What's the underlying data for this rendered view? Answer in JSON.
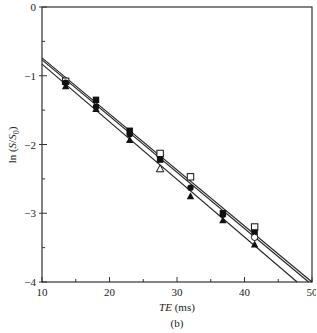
{
  "chart_data": {
    "type": "scatter",
    "title": "",
    "panel_label": "(b)",
    "xlabel": "TE (ms)",
    "xlabel_italic_part": "TE",
    "xlabel_unit": "(ms)",
    "ylabel": "ln (S/S0)",
    "xlim": [
      10,
      50
    ],
    "ylim": [
      -4,
      0
    ],
    "x_ticks": [
      10,
      20,
      30,
      40,
      50
    ],
    "x_minor_ticks": [
      15,
      25,
      35,
      45
    ],
    "y_ticks": [
      0,
      -1,
      -2,
      -3,
      -4
    ],
    "y_minor_ticks": [
      -0.5,
      -1.5,
      -2.5,
      -3.5
    ],
    "grid": false,
    "legend": "none",
    "series": [
      {
        "name": "open-square",
        "marker": "square-open",
        "x": [
          13.5,
          27.5,
          32.0,
          41.5
        ],
        "y": [
          -1.08,
          -2.13,
          -2.47,
          -3.2
        ]
      },
      {
        "name": "filled-square",
        "marker": "square-filled",
        "x": [
          18.0,
          23.0,
          27.5,
          36.8,
          41.5
        ],
        "y": [
          -1.35,
          -1.8,
          -2.22,
          -3.0,
          -3.28
        ]
      },
      {
        "name": "filled-circle",
        "marker": "circle-filled",
        "x": [
          13.5,
          18.0,
          23.0,
          32.0,
          36.8
        ],
        "y": [
          -1.1,
          -1.45,
          -1.85,
          -2.63,
          -3.02
        ]
      },
      {
        "name": "open-circle",
        "marker": "circle-open",
        "x": [
          41.5
        ],
        "y": [
          -3.35
        ]
      },
      {
        "name": "filled-triangle",
        "marker": "triangle-filled",
        "x": [
          13.5,
          18.0,
          23.0,
          32.0,
          36.8,
          41.5
        ],
        "y": [
          -1.15,
          -1.48,
          -1.93,
          -2.75,
          -3.1,
          -3.45
        ]
      },
      {
        "name": "open-triangle",
        "marker": "triangle-open",
        "x": [
          27.5
        ],
        "y": [
          -2.35
        ]
      }
    ],
    "fit_lines": [
      {
        "name": "fit-1",
        "x": [
          10,
          50
        ],
        "y": [
          -0.74,
          -4.0
        ]
      },
      {
        "name": "fit-2",
        "x": [
          10,
          49.5
        ],
        "y": [
          -0.77,
          -4.0
        ]
      },
      {
        "name": "fit-3",
        "x": [
          10,
          47.8
        ],
        "y": [
          -0.83,
          -4.0
        ]
      }
    ]
  }
}
